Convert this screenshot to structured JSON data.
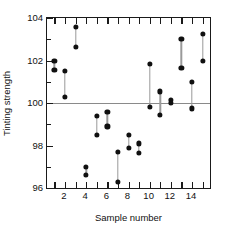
{
  "chart_data": {
    "type": "scatter",
    "title": "",
    "xlabel": "Sample number",
    "ylabel": "Tinting strength",
    "xlim": [
      0.3,
      15.7
    ],
    "ylim": [
      96,
      104
    ],
    "yticks": [
      96,
      98,
      100,
      102,
      104
    ],
    "yticklabels": [
      "96",
      "98",
      "100",
      "102",
      "104"
    ],
    "yminorticks": [
      97,
      99,
      101,
      103
    ],
    "xticks": [
      1,
      2,
      3,
      4,
      5,
      6,
      7,
      8,
      9,
      10,
      11,
      12,
      13,
      14,
      15
    ],
    "xticklabels": [
      "",
      "2",
      "",
      "4",
      "",
      "6",
      "",
      "8",
      "",
      "10",
      "",
      "12",
      "",
      "14",
      ""
    ],
    "grid": false,
    "legend": null,
    "reference_line": {
      "y": 100,
      "color": "#8a8a8a"
    },
    "marker_color": "#101010",
    "segment_color": "#9a9a9a",
    "series_note": "Each sample shows two observations joined by a vertical line",
    "categories": [
      1,
      2,
      3,
      4,
      5,
      6,
      7,
      8,
      9,
      10,
      11,
      12,
      13,
      14,
      15
    ],
    "series": [
      {
        "name": "Observation 1",
        "values": [
          102.0,
          101.5,
          103.6,
          97.0,
          99.4,
          99.6,
          97.7,
          98.5,
          98.1,
          101.85,
          100.55,
          100.15,
          103.0,
          101.0,
          103.25
        ]
      },
      {
        "name": "Observation 2",
        "values": [
          101.55,
          100.3,
          102.65,
          96.6,
          98.5,
          98.9,
          96.3,
          97.9,
          97.65,
          99.8,
          99.45,
          100.0,
          101.65,
          99.75,
          102.0
        ]
      }
    ],
    "points": [
      {
        "sample": 1,
        "high": 102.0,
        "low": 101.55
      },
      {
        "sample": 2,
        "high": 101.5,
        "low": 100.3
      },
      {
        "sample": 3,
        "high": 103.6,
        "low": 102.65
      },
      {
        "sample": 4,
        "high": 97.0,
        "low": 96.6
      },
      {
        "sample": 5,
        "high": 99.4,
        "low": 98.5
      },
      {
        "sample": 6,
        "high": 99.6,
        "low": 98.9
      },
      {
        "sample": 7,
        "high": 97.7,
        "low": 96.3
      },
      {
        "sample": 8,
        "high": 98.5,
        "low": 97.9
      },
      {
        "sample": 9,
        "high": 98.1,
        "low": 97.65
      },
      {
        "sample": 10,
        "high": 101.85,
        "low": 99.8
      },
      {
        "sample": 11,
        "high": 100.55,
        "low": 99.45
      },
      {
        "sample": 12,
        "high": 100.15,
        "low": 100.0
      },
      {
        "sample": 13,
        "high": 103.0,
        "low": 101.65
      },
      {
        "sample": 14,
        "high": 101.0,
        "low": 99.75
      },
      {
        "sample": 15,
        "high": 103.25,
        "low": 102.0
      }
    ]
  }
}
